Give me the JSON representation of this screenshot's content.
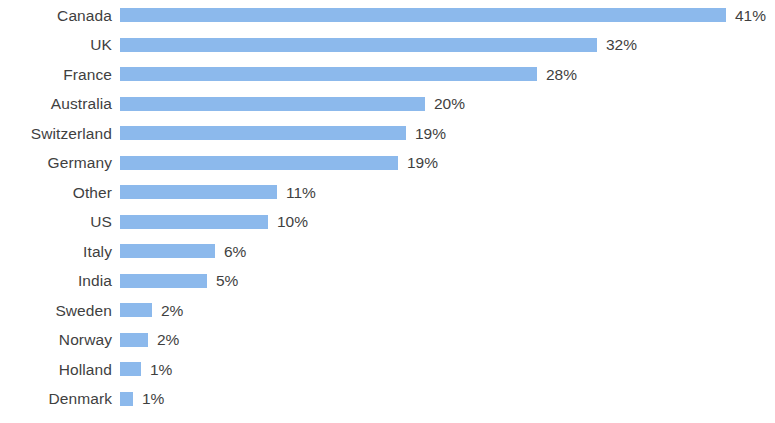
{
  "chart_data": {
    "type": "bar",
    "orientation": "horizontal",
    "title": "",
    "subtitle": "",
    "xlabel": "",
    "ylabel": "",
    "grid": false,
    "legend": null,
    "axis_visible": false,
    "xlim": [
      0,
      44
    ],
    "value_suffix": "%",
    "bar_color": "#8cb9ec",
    "text_color": "#3f3f3f",
    "background": "#ffffff",
    "categories": [
      "Canada",
      "UK",
      "France",
      "Australia",
      "Switzerland",
      "Germany",
      "Other",
      "US",
      "Italy",
      "India",
      "Sweden",
      "Norway",
      "Holland",
      "Denmark"
    ],
    "values": [
      41,
      32,
      28,
      20,
      19,
      19,
      11,
      10,
      6,
      5,
      2,
      2,
      1,
      1
    ],
    "data_labels": [
      "41%",
      "32%",
      "28%",
      "20%",
      "19%",
      "19%",
      "11%",
      "10%",
      "6%",
      "5%",
      "2%",
      "2%",
      "1%",
      "1%"
    ],
    "bar_pixel_widths": [
      606,
      477,
      417,
      305,
      286,
      278,
      157,
      148,
      95,
      87,
      32,
      28,
      21,
      13
    ]
  }
}
